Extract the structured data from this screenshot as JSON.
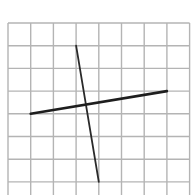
{
  "diagram": {
    "type": "grid-with-line-segments",
    "background": "#ffffff",
    "grid": {
      "columns": 8,
      "rows": 8,
      "origin_px": [
        8,
        23
      ],
      "cell_px": 22.7,
      "line_color": "#b4b4b4",
      "line_width": 1.4
    },
    "segments": [
      {
        "name": "steep-segment",
        "from_cell": [
          3,
          1
        ],
        "to_cell": [
          4,
          7
        ],
        "color": "#2a2a2a",
        "width": 1.8
      },
      {
        "name": "shallow-segment",
        "from_cell": [
          1,
          4
        ],
        "to_cell": [
          7,
          3
        ],
        "color": "#1e1e1e",
        "width": 2.6
      }
    ]
  }
}
